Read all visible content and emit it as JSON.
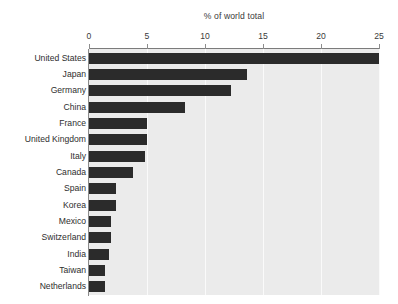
{
  "chart_data": {
    "type": "bar",
    "orientation": "horizontal",
    "title": "% of world total",
    "xlabel": "% of world total",
    "ylabel": "",
    "xlim": [
      0,
      25
    ],
    "xticks": [
      0,
      5,
      10,
      15,
      20,
      25
    ],
    "xtick_labels": [
      "0",
      "5",
      "10",
      "15",
      "20",
      "25"
    ],
    "grid": "vertical",
    "legend": "none",
    "axis_position": "top",
    "categories": [
      "United States",
      "Japan",
      "Germany",
      "China",
      "France",
      "United Kingdom",
      "Italy",
      "Canada",
      "Spain",
      "Korea",
      "Mexico",
      "Switzerland",
      "India",
      "Taiwan",
      "Netherlands"
    ],
    "values": [
      25.0,
      13.6,
      12.2,
      8.3,
      5.0,
      5.0,
      4.8,
      3.8,
      2.3,
      2.3,
      1.9,
      1.9,
      1.7,
      1.4,
      1.4
    ],
    "colors": {
      "bar": "#2b2b2b",
      "plot_background": "#ebebeb",
      "gridline": "#fafafa",
      "axis": "#7b7b7b",
      "text": "#2e2e2e",
      "page_background": "#ffffff"
    }
  }
}
